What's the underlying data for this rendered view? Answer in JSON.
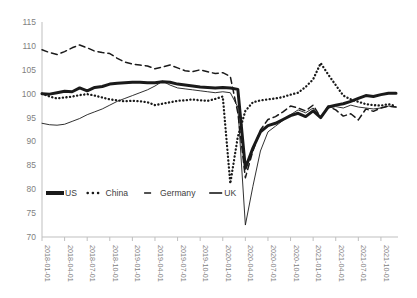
{
  "chart_data": {
    "type": "line",
    "title": "",
    "xlabel": "",
    "ylabel": "",
    "ylim": [
      70,
      115
    ],
    "ytick_step": 5,
    "yticks": [
      70,
      75,
      80,
      85,
      90,
      95,
      100,
      105,
      110,
      115
    ],
    "grid": false,
    "legend_position": "inside-bottom-left",
    "x_tick_labels": [
      "2018-01-01",
      "2018-04-01",
      "2018-07-01",
      "2018-10-01",
      "2019-01-01",
      "2019-04-01",
      "2019-07-01",
      "2019-10-01",
      "2020-01-01",
      "2020-04-01",
      "2020-07-01",
      "2020-10-01",
      "2021-01-01",
      "2021-04-01",
      "2021-07-01",
      "2021-10-01"
    ],
    "x": [
      "2018-01",
      "2018-02",
      "2018-03",
      "2018-04",
      "2018-05",
      "2018-06",
      "2018-07",
      "2018-08",
      "2018-09",
      "2018-10",
      "2018-11",
      "2018-12",
      "2019-01",
      "2019-02",
      "2019-03",
      "2019-04",
      "2019-05",
      "2019-06",
      "2019-07",
      "2019-08",
      "2019-09",
      "2019-10",
      "2019-11",
      "2019-12",
      "2020-01",
      "2020-02",
      "2020-03",
      "2020-04",
      "2020-05",
      "2020-06",
      "2020-07",
      "2020-08",
      "2020-09",
      "2020-10",
      "2020-11",
      "2020-12",
      "2021-01",
      "2021-02",
      "2021-03",
      "2021-04",
      "2021-05",
      "2021-06",
      "2021-07",
      "2021-08",
      "2021-09",
      "2021-10",
      "2021-11",
      "2021-12"
    ],
    "series": [
      {
        "name": "US",
        "style": "thick-solid",
        "color": "#1a1a1a",
        "values": [
          100.0,
          99.9,
          100.2,
          100.5,
          100.4,
          101.2,
          100.6,
          101.3,
          101.5,
          102.0,
          102.2,
          102.3,
          102.4,
          102.4,
          102.3,
          102.3,
          102.5,
          102.4,
          102.0,
          101.8,
          101.6,
          101.4,
          101.3,
          101.2,
          101.3,
          101.2,
          100.9,
          84.4,
          88.6,
          92.0,
          93.3,
          93.8,
          94.6,
          95.4,
          95.9,
          95.2,
          96.4,
          95.0,
          97.2,
          97.6,
          97.9,
          98.4,
          99.0,
          99.6,
          99.4,
          99.8,
          100.1,
          100.1
        ]
      },
      {
        "name": "China",
        "style": "dotted",
        "color": "#1a1a1a",
        "values": [
          100.0,
          99.4,
          99.0,
          99.2,
          99.4,
          99.7,
          99.9,
          99.6,
          99.2,
          98.8,
          98.6,
          98.4,
          98.5,
          98.4,
          98.2,
          97.6,
          97.9,
          98.2,
          98.5,
          98.6,
          98.8,
          98.6,
          98.5,
          98.9,
          99.4,
          81.2,
          91.0,
          96.4,
          98.2,
          98.6,
          98.8,
          99.0,
          99.3,
          99.8,
          100.2,
          101.4,
          103.0,
          106.4,
          104.0,
          101.8,
          99.6,
          98.8,
          98.3,
          97.8,
          97.6,
          97.5,
          97.8,
          97.4
        ]
      },
      {
        "name": "Germany",
        "style": "dashed",
        "color": "#1a1a1a",
        "values": [
          109.2,
          108.6,
          108.2,
          108.8,
          109.6,
          110.2,
          109.6,
          108.9,
          108.6,
          108.4,
          107.4,
          106.6,
          106.2,
          106.0,
          105.8,
          105.2,
          105.6,
          106.0,
          105.4,
          104.8,
          104.6,
          105.0,
          104.6,
          104.2,
          104.4,
          103.6,
          96.0,
          82.4,
          88.0,
          92.4,
          94.6,
          95.2,
          96.2,
          97.4,
          97.0,
          96.4,
          97.6,
          95.0,
          97.4,
          96.6,
          95.3,
          95.8,
          94.5,
          96.8,
          96.3,
          97.0,
          97.4,
          97.2
        ]
      },
      {
        "name": "UK",
        "style": "thin-solid",
        "color": "#1a1a1a",
        "values": [
          93.8,
          93.5,
          93.4,
          93.6,
          94.2,
          94.8,
          95.6,
          96.2,
          96.8,
          97.6,
          98.4,
          99.0,
          99.6,
          100.2,
          100.8,
          101.6,
          102.6,
          101.8,
          101.2,
          101.0,
          100.8,
          100.6,
          100.4,
          100.2,
          100.4,
          100.2,
          97.2,
          72.5,
          80.6,
          88.0,
          92.0,
          93.2,
          94.4,
          95.6,
          96.6,
          96.0,
          97.0,
          94.8,
          97.0,
          97.3,
          97.0,
          97.6,
          97.2,
          97.0,
          96.8,
          97.0,
          97.4,
          97.2
        ]
      }
    ],
    "legend": [
      {
        "label": "US",
        "marker": "thick-solid"
      },
      {
        "label": "China",
        "marker": "dotted"
      },
      {
        "label": "Germany",
        "marker": "dashed"
      },
      {
        "label": "UK",
        "marker": "thin-solid"
      }
    ]
  }
}
